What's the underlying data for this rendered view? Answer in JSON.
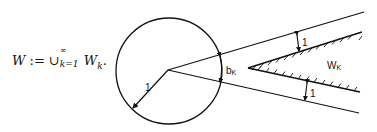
{
  "formula": {
    "lhs": "W",
    "assign": " := ",
    "union": "∪",
    "sup": "∞",
    "sub": "k=1",
    "term": "W",
    "term_sub": "k",
    "end": "."
  },
  "diagram": {
    "radius_label": "1",
    "angle_label_main": "b",
    "angle_label_sub": "K",
    "region_label_main": "W",
    "region_label_sub": "K",
    "upper_gap_label": "1",
    "lower_gap_label": "1"
  }
}
